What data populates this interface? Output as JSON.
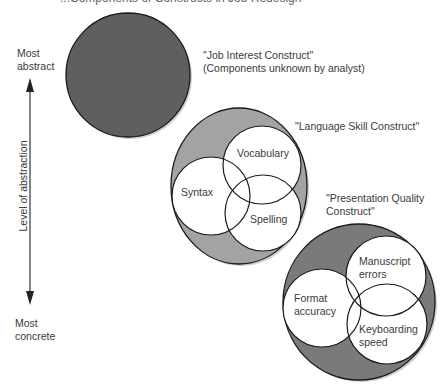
{
  "header": {
    "cut_title": "...Components of Constructs in Job Redesign"
  },
  "axis": {
    "top_label_line1": "Most",
    "top_label_line2": "abstract",
    "bottom_label_line1": "Most",
    "bottom_label_line2": "concrete",
    "axis_title": "Level of abstraction"
  },
  "constructs": [
    {
      "title": "\"Job Interest Construct\"",
      "subtitle": "(Components unknown by analyst)",
      "fill": "#5f5f5f",
      "components": []
    },
    {
      "title": "\"Language Skill Construct\"",
      "fill": "#a3a3a3",
      "components": [
        "Vocabulary",
        "Syntax",
        "Spelling"
      ]
    },
    {
      "title_line1": "\"Presentation Quality",
      "title_line2": "Construct\"",
      "fill": "#7a7a7a",
      "components": [
        {
          "line1": "Manuscript",
          "line2": "errors"
        },
        {
          "line1": "Format",
          "line2": "accuracy"
        },
        {
          "line1": "Keyboarding",
          "line2": "speed"
        }
      ]
    }
  ],
  "colors": {
    "outline": "#1a1a1a",
    "shadow": "#c8c8c8",
    "component_fill": "#ffffff"
  }
}
